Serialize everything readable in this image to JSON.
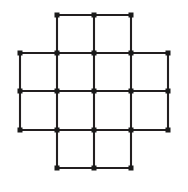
{
  "figure": {
    "background_color": "#ffffff",
    "edge_color": "#231f20",
    "node_color": "#1a1a1a",
    "edge_width": 2.1,
    "node_size": 5,
    "node_shape": "square",
    "width": 188,
    "height": 192
  },
  "chart_data": {
    "type": "scatter",
    "title": "",
    "xlabel": "",
    "ylabel": "",
    "grid": false,
    "legend": null,
    "xlim": [
      0,
      188
    ],
    "ylim": [
      0,
      192
    ],
    "columns_x": [
      20,
      57,
      94,
      131,
      168
    ],
    "rows_y": [
      15,
      53,
      91,
      130,
      168
    ],
    "grid_spacing_x": 37,
    "grid_spacing_y": 38.25,
    "node_count": 21,
    "edge_count": 40,
    "nodes": [
      {
        "id": "r0c1",
        "row": 0,
        "col": 1,
        "x": 57,
        "y": 15
      },
      {
        "id": "r0c2",
        "row": 0,
        "col": 2,
        "x": 94,
        "y": 15
      },
      {
        "id": "r0c3",
        "row": 0,
        "col": 3,
        "x": 131,
        "y": 15
      },
      {
        "id": "r1c0",
        "row": 1,
        "col": 0,
        "x": 20,
        "y": 53
      },
      {
        "id": "r1c1",
        "row": 1,
        "col": 1,
        "x": 57,
        "y": 53
      },
      {
        "id": "r1c2",
        "row": 1,
        "col": 2,
        "x": 94,
        "y": 53
      },
      {
        "id": "r1c3",
        "row": 1,
        "col": 3,
        "x": 131,
        "y": 53
      },
      {
        "id": "r1c4",
        "row": 1,
        "col": 4,
        "x": 168,
        "y": 53
      },
      {
        "id": "r2c0",
        "row": 2,
        "col": 0,
        "x": 20,
        "y": 91
      },
      {
        "id": "r2c1",
        "row": 2,
        "col": 1,
        "x": 57,
        "y": 91
      },
      {
        "id": "r2c2",
        "row": 2,
        "col": 2,
        "x": 94,
        "y": 91
      },
      {
        "id": "r2c3",
        "row": 2,
        "col": 3,
        "x": 131,
        "y": 91
      },
      {
        "id": "r2c4",
        "row": 2,
        "col": 4,
        "x": 168,
        "y": 91
      },
      {
        "id": "r3c0",
        "row": 3,
        "col": 0,
        "x": 20,
        "y": 130
      },
      {
        "id": "r3c1",
        "row": 3,
        "col": 1,
        "x": 57,
        "y": 130
      },
      {
        "id": "r3c2",
        "row": 3,
        "col": 2,
        "x": 94,
        "y": 130
      },
      {
        "id": "r3c3",
        "row": 3,
        "col": 3,
        "x": 131,
        "y": 130
      },
      {
        "id": "r3c4",
        "row": 3,
        "col": 4,
        "x": 168,
        "y": 130
      },
      {
        "id": "r4c1",
        "row": 4,
        "col": 1,
        "x": 57,
        "y": 168
      },
      {
        "id": "r4c2",
        "row": 4,
        "col": 2,
        "x": 94,
        "y": 168
      },
      {
        "id": "r4c3",
        "row": 4,
        "col": 3,
        "x": 131,
        "y": 168
      }
    ],
    "edges": [
      {
        "from": "r0c1",
        "to": "r0c2"
      },
      {
        "from": "r0c2",
        "to": "r0c3"
      },
      {
        "from": "r1c0",
        "to": "r1c1"
      },
      {
        "from": "r1c1",
        "to": "r1c2"
      },
      {
        "from": "r1c2",
        "to": "r1c3"
      },
      {
        "from": "r1c3",
        "to": "r1c4"
      },
      {
        "from": "r2c0",
        "to": "r2c1"
      },
      {
        "from": "r2c1",
        "to": "r2c2"
      },
      {
        "from": "r2c2",
        "to": "r2c3"
      },
      {
        "from": "r2c3",
        "to": "r2c4"
      },
      {
        "from": "r3c0",
        "to": "r3c1"
      },
      {
        "from": "r3c1",
        "to": "r3c2"
      },
      {
        "from": "r3c2",
        "to": "r3c3"
      },
      {
        "from": "r3c3",
        "to": "r3c4"
      },
      {
        "from": "r4c1",
        "to": "r4c2"
      },
      {
        "from": "r4c2",
        "to": "r4c3"
      },
      {
        "from": "r0c1",
        "to": "r1c1"
      },
      {
        "from": "r0c2",
        "to": "r1c2"
      },
      {
        "from": "r0c3",
        "to": "r1c3"
      },
      {
        "from": "r1c0",
        "to": "r2c0"
      },
      {
        "from": "r1c1",
        "to": "r2c1"
      },
      {
        "from": "r1c2",
        "to": "r2c2"
      },
      {
        "from": "r1c3",
        "to": "r2c3"
      },
      {
        "from": "r1c4",
        "to": "r2c4"
      },
      {
        "from": "r2c0",
        "to": "r3c0"
      },
      {
        "from": "r2c1",
        "to": "r3c1"
      },
      {
        "from": "r2c2",
        "to": "r3c2"
      },
      {
        "from": "r2c3",
        "to": "r3c3"
      },
      {
        "from": "r2c4",
        "to": "r3c4"
      },
      {
        "from": "r3c1",
        "to": "r4c1"
      },
      {
        "from": "r3c2",
        "to": "r4c2"
      },
      {
        "from": "r3c3",
        "to": "r4c3"
      }
    ]
  }
}
